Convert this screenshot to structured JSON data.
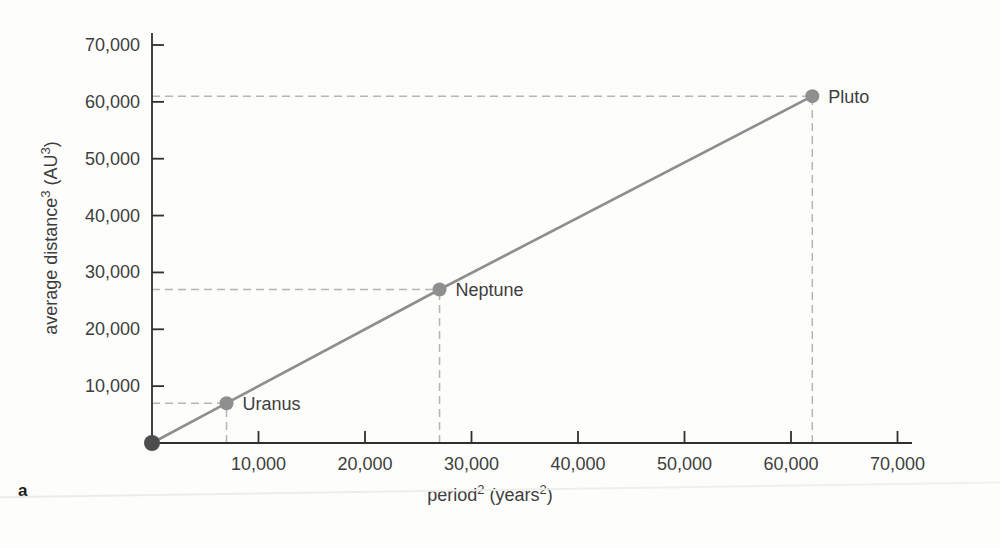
{
  "figure": {
    "panel_label": "a"
  },
  "chart_data": {
    "type": "line",
    "title": "",
    "xlabel": "period² (years²)",
    "ylabel": "average distance³ (AU³)",
    "xlabel_parts": [
      {
        "text": "period"
      },
      {
        "text": "2",
        "sup": true
      },
      {
        "text": " (years"
      },
      {
        "text": "2",
        "sup": true
      },
      {
        "text": ")"
      }
    ],
    "ylabel_parts": [
      {
        "text": "average distance"
      },
      {
        "text": "3",
        "sup": true
      },
      {
        "text": " (AU"
      },
      {
        "text": "3",
        "sup": true
      },
      {
        "text": ")"
      }
    ],
    "xlim": [
      0,
      71500
    ],
    "ylim": [
      0,
      71500
    ],
    "xticks": [
      10000,
      20000,
      30000,
      40000,
      50000,
      60000,
      70000
    ],
    "yticks": [
      10000,
      20000,
      30000,
      40000,
      50000,
      60000,
      70000
    ],
    "grid": false,
    "legend_position": "none",
    "series": [
      {
        "name": "planets",
        "points": [
          {
            "x": 0,
            "y": 0,
            "label": null
          },
          {
            "x": 7000,
            "y": 7000,
            "label": "Uranus"
          },
          {
            "x": 27000,
            "y": 27000,
            "label": "Neptune"
          },
          {
            "x": 62000,
            "y": 61000,
            "label": "Pluto"
          }
        ]
      }
    ],
    "guides": "dashed lines from each labeled point to both axes",
    "colors": {
      "line": "#8e8e8e",
      "point": "#8f8f8f",
      "origin_point": "#4d4d4d",
      "guide_dash": "#b5b5b5",
      "axis": "#2f2f2f",
      "text": "#3d3d3d"
    }
  }
}
